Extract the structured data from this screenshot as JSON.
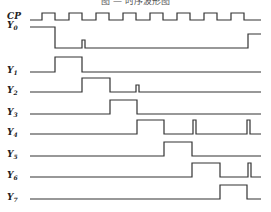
{
  "title": "图 — 时序波形图",
  "signals": [
    {
      "name": "CP",
      "sub": "",
      "label_y": 19,
      "high_y": 13,
      "low_y": 20,
      "path": "M30,20 L42,20 L42,13 L55,13 L55,20 L69,20 L69,13 L82,13 L82,20 L96,20 L96,13 L109,13 L109,20 L123,20 L123,13 L136,13 L136,20 L150,20 L150,13 L163,13 L163,20 L177,20 L177,13 L190,13 L190,20 L204,20 L204,13 L217,13 L217,20 L231,20 L231,13 L244,13 L244,20 L261,20"
    },
    {
      "name": "Y",
      "sub": "0",
      "label_y": 28,
      "path": "M30,27 L55,27 L55,48 L82,48 L82,40 L85,40 L85,48 L248,48 L248,34 L261,34"
    },
    {
      "name": "Y",
      "sub": "1",
      "label_y": 73,
      "path": "M30,72 L55,72 L55,57 L82,57 L82,72 L261,72"
    },
    {
      "name": "Y",
      "sub": "2",
      "label_y": 93,
      "path": "M30,92 L82,92 L82,78 L110,78 L110,92 L136,92 L136,85 L139,85 L139,92 L261,92"
    },
    {
      "name": "Y",
      "sub": "3",
      "label_y": 115,
      "path": "M30,114 L110,114 L110,100 L137,100 L137,114 L261,114"
    },
    {
      "name": "Y",
      "sub": "4",
      "label_y": 135,
      "path": "M30,134 L137,134 L137,120 L164,120 L164,134 L193,134 L193,120 L196,120 L196,134 L247,134 L247,120 L250,120 L250,134 L261,134"
    },
    {
      "name": "Y",
      "sub": "5",
      "label_y": 157,
      "path": "M30,156 L164,156 L164,142 L192,142 L192,156 L261,156"
    },
    {
      "name": "Y",
      "sub": "6",
      "label_y": 178,
      "path": "M30,177 L192,177 L192,163 L220,163 L220,177 L248,177 L248,163 L251,163 L251,177 L261,177"
    },
    {
      "name": "Y",
      "sub": "7",
      "label_y": 200,
      "path": "M30,199 L220,199 L220,185 L247,185 L247,199 L261,199"
    }
  ]
}
